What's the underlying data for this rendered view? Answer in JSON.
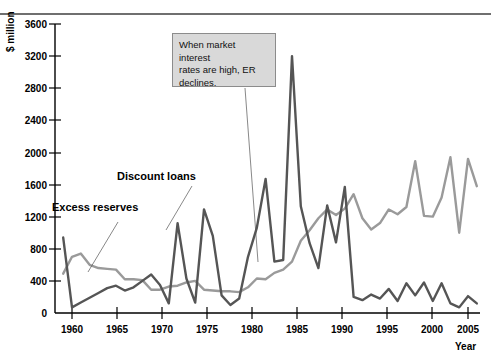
{
  "chart_data": {
    "type": "line",
    "title": "",
    "xlabel": "Year",
    "ylabel": "$ million",
    "xlim": [
      1959,
      2006
    ],
    "ylim": [
      0,
      3600
    ],
    "grid": false,
    "legend_position": "inline-annotations",
    "xticks": [
      1960,
      1965,
      1970,
      1975,
      1980,
      1985,
      1990,
      1995,
      2000,
      2005
    ],
    "yticks": [
      0,
      400,
      800,
      1200,
      1600,
      2000,
      2400,
      2800,
      3200,
      3600
    ],
    "x": [
      1959,
      1960,
      1961,
      1962,
      1963,
      1964,
      1965,
      1966,
      1967,
      1968,
      1969,
      1970,
      1971,
      1972,
      1973,
      1974,
      1975,
      1976,
      1977,
      1978,
      1979,
      1980,
      1981,
      1982,
      1983,
      1984,
      1985,
      1986,
      1987,
      1988,
      1989,
      1990,
      1991,
      1992,
      1993,
      1994,
      1995,
      1996,
      1997,
      1998,
      1999,
      2000,
      2001,
      2002,
      2003,
      2004,
      2005,
      2006
    ],
    "series": [
      {
        "name": "Excess reserves",
        "color": "#9a9a9a",
        "values": [
          490,
          700,
          740,
          600,
          560,
          550,
          540,
          420,
          420,
          410,
          290,
          290,
          330,
          340,
          380,
          400,
          290,
          280,
          270,
          270,
          260,
          320,
          430,
          420,
          500,
          540,
          640,
          900,
          1030,
          1180,
          1290,
          1220,
          1300,
          1480,
          1180,
          1040,
          1120,
          1290,
          1230,
          1320,
          1890,
          1210,
          1200,
          1440,
          1940,
          1000,
          1920,
          1580
        ]
      },
      {
        "name": "Discount loans",
        "color": "#555555",
        "values": [
          940,
          70,
          130,
          190,
          250,
          310,
          340,
          280,
          320,
          400,
          480,
          350,
          120,
          1120,
          430,
          130,
          1290,
          960,
          220,
          100,
          180,
          700,
          1060,
          1670,
          640,
          660,
          3200,
          1330,
          870,
          560,
          1340,
          880,
          1570,
          200,
          160,
          230,
          180,
          300,
          150,
          370,
          220,
          380,
          150,
          370,
          120,
          70,
          210,
          120
        ]
      }
    ],
    "annotations": [
      {
        "text": "When market interest rates are high, ER declines.",
        "lines": [
          "When market interest",
          "rates are high, ER",
          "declines."
        ],
        "target_year": 1982
      },
      {
        "label": "Excess reserves",
        "type": "series-callout"
      },
      {
        "label": "Discount loans",
        "type": "series-callout"
      }
    ]
  },
  "axis": {
    "y_title": "$ million",
    "x_title": "Year",
    "y_ticks": [
      "0",
      "400",
      "800",
      "1200",
      "1600",
      "2000",
      "2400",
      "2800",
      "3200",
      "3600"
    ],
    "x_ticks": [
      "1960",
      "1965",
      "1970",
      "1975",
      "1980",
      "1985",
      "1990",
      "1995",
      "2000",
      "2005"
    ]
  },
  "labels": {
    "excess_reserves": "Excess reserves",
    "discount_loans": "Discount loans"
  },
  "annotation": {
    "line1": "When market interest",
    "line2": "rates are high, ER",
    "line3": "declines."
  },
  "colors": {
    "excess_reserves": "#9a9a9a",
    "discount_loans": "#555555",
    "axis": "#000000",
    "annotation_bg": "#d9d9d9",
    "annotation_border": "#8c8c8c",
    "top_rule": "#6f6f6f"
  }
}
